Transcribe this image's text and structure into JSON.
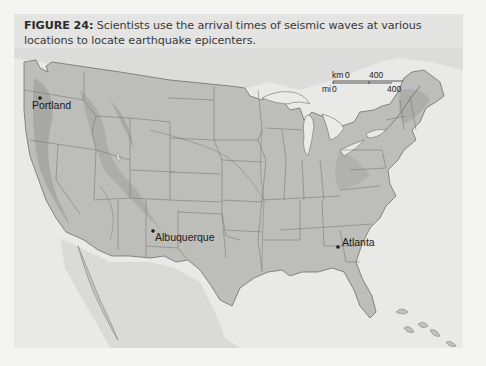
{
  "figure": {
    "label": "FIGURE 24:",
    "caption": "Scientists use the arrival times of seismic waves at various locations to locate earthquake epicenters."
  },
  "map": {
    "region": "Contiguous United States",
    "colors": {
      "panel_bg": "#e4e4e2",
      "land": "#b9b9b6",
      "land_light": "#c8c8c5",
      "mountains": "#9f9f9c",
      "water": "#e9e9e7",
      "borders": "#6e6e6c"
    },
    "cities": [
      {
        "name": "Portland",
        "x": 42,
        "y": 102
      },
      {
        "name": "Albuquerque",
        "x": 152,
        "y": 233
      },
      {
        "name": "Atlanta",
        "x": 338,
        "y": 247
      }
    ],
    "scale_bar": {
      "km_label": "km",
      "km_start": "0",
      "km_end": "400",
      "mi_label": "mi",
      "mi_start": "0",
      "mi_end": "400"
    }
  }
}
